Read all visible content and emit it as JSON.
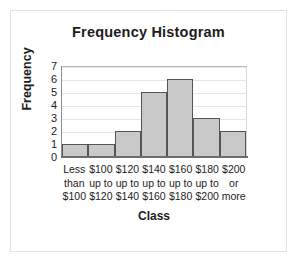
{
  "chart_data": {
    "type": "bar",
    "title": "Frequency Histogram",
    "xlabel": "Class",
    "ylabel": "Frequency",
    "categories": [
      "Less than $100",
      "$100 up to $120",
      "$120 up to $140",
      "$140 up to $160",
      "$160 up to $180",
      "$180 up to $200",
      "$200 or more"
    ],
    "category_lines": [
      [
        "Less",
        "than",
        "$100"
      ],
      [
        "$100",
        "up to",
        "$120"
      ],
      [
        "$120",
        "up to",
        "$140"
      ],
      [
        "$140",
        "up to",
        "$160"
      ],
      [
        "$160",
        "up to",
        "$180"
      ],
      [
        "$180",
        "up to",
        "$200"
      ],
      [
        "$200",
        "or",
        "more"
      ]
    ],
    "values": [
      1,
      1,
      2,
      5,
      6,
      3,
      2
    ],
    "ylim": [
      0,
      7
    ],
    "yticks": [
      0,
      1,
      2,
      3,
      4,
      5,
      6,
      7
    ],
    "grid": true,
    "legend": null,
    "bar_fill": "#c9c9c9",
    "bar_border": "#555555",
    "gridline_color": "#e6e6e6",
    "axis_color": "#6d6d6d",
    "background": "#ffffff"
  }
}
